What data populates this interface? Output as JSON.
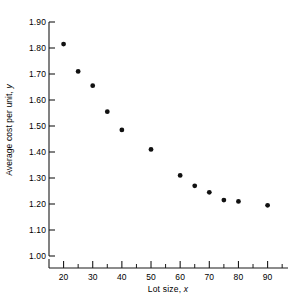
{
  "chart_data": {
    "type": "scatter",
    "title": "",
    "xlabel": "Lot size, x",
    "ylabel": "Average cost per unit, y",
    "xlim": [
      15,
      97
    ],
    "ylim": [
      1.0,
      1.9
    ],
    "grid": false,
    "legend": null,
    "x_ticks": [
      20,
      30,
      40,
      50,
      60,
      70,
      80,
      90
    ],
    "x_tick_labels": [
      "20",
      "30",
      "40",
      "50",
      "60",
      "70",
      "80",
      "90"
    ],
    "x_minor_ticks": [
      25,
      35,
      45,
      55,
      65,
      75,
      85,
      95
    ],
    "y_ticks": [
      1.0,
      1.1,
      1.2,
      1.3,
      1.4,
      1.5,
      1.6,
      1.7,
      1.8,
      1.9
    ],
    "y_tick_labels": [
      "1.00",
      "1.10",
      "1.20",
      "1.30",
      "1.40",
      "1.50",
      "1.60",
      "1.70",
      "1.80",
      "1.90"
    ],
    "marker": "filled-circle",
    "marker_color": "#111111",
    "x": [
      20,
      25,
      30,
      35,
      40,
      50,
      60,
      65,
      70,
      75,
      80,
      90
    ],
    "y": [
      1.815,
      1.71,
      1.655,
      1.555,
      1.485,
      1.41,
      1.31,
      1.27,
      1.245,
      1.215,
      1.21,
      1.195
    ],
    "points": [
      {
        "x": 20,
        "y": 1.815
      },
      {
        "x": 25,
        "y": 1.71
      },
      {
        "x": 30,
        "y": 1.655
      },
      {
        "x": 35,
        "y": 1.555
      },
      {
        "x": 40,
        "y": 1.485
      },
      {
        "x": 50,
        "y": 1.41
      },
      {
        "x": 60,
        "y": 1.31
      },
      {
        "x": 65,
        "y": 1.27
      },
      {
        "x": 70,
        "y": 1.245
      },
      {
        "x": 75,
        "y": 1.215
      },
      {
        "x": 80,
        "y": 1.21
      },
      {
        "x": 90,
        "y": 1.195
      }
    ]
  },
  "axes": {
    "y_axis_label_text": "Average cost per unit, ",
    "y_axis_label_var": "y",
    "x_axis_label_text": "Lot size, ",
    "x_axis_label_var": "x"
  }
}
